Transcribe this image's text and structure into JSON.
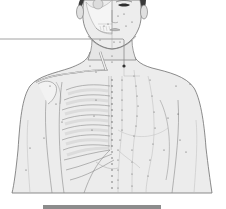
{
  "illustration": {
    "subject": "anatomical acupuncture chart of human torso",
    "left_half": "skeleton overlay (skull, clavicle, ribcage)",
    "right_half": "skin surface with meridian point lines",
    "colors": {
      "background": "#ffffff",
      "skin": "#ececec",
      "skin_shadow": "#d9d9d9",
      "outline": "#6e6e6e",
      "bone": "#f4f4f4",
      "bone_shade": "#cfcfcf",
      "hair": "#3a3a3a",
      "points": "#555555",
      "callout_line": "#8a8a8a",
      "callout_dot": "#333333",
      "bottom_bar": "#8c8c8c"
    }
  },
  "callout": {
    "line_y": 39,
    "line_end_x": 123,
    "drop_to_y": 66
  },
  "bottom_bar": {
    "x": 43,
    "width": 118,
    "color": "#8c8c8c"
  }
}
